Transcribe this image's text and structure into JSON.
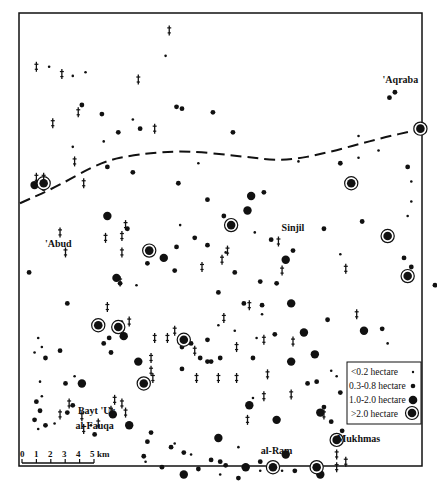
{
  "map": {
    "units": "km",
    "extent_km": {
      "width": 22.1,
      "height": 24.9
    },
    "colors": {
      "ink": "#111111",
      "paper": "#ffffff"
    }
  },
  "scale_bar": {
    "ticks": [
      "0",
      "1",
      "2",
      "3",
      "4",
      "5"
    ],
    "unit_label": "km",
    "length_km": 5
  },
  "legend": {
    "items": [
      {
        "label": "<0.2 hectare",
        "symbol": "tiny-dot"
      },
      {
        "label": "0.3-0.8 hectare",
        "symbol": "small-dot"
      },
      {
        "label": "1.0-2.0 hectare",
        "symbol": "large-dot"
      },
      {
        "label": ">2.0 hectare",
        "symbol": "ringed-dot"
      }
    ]
  },
  "places": [
    {
      "name": "'Aqraba",
      "x": 20.9,
      "y": 3.8
    },
    {
      "name": "Sinjil",
      "x": 15.0,
      "y": 11.9
    },
    {
      "name": "'Abud",
      "x": 2.1,
      "y": 12.8
    },
    {
      "name": "Bayt 'Ur",
      "x": 4.2,
      "y": 22.0
    },
    {
      "name": "al-Fauqa",
      "x": 4.1,
      "y": 22.8
    },
    {
      "name": "al-Ram",
      "x": 14.1,
      "y": 24.2
    },
    {
      "name": "Mukhmas",
      "x": 18.6,
      "y": 23.5
    }
  ],
  "boundary_km": [
    [
      0,
      10.4
    ],
    [
      2,
      9.5
    ],
    [
      4.5,
      8.1
    ],
    [
      6.5,
      7.7
    ],
    [
      9,
      7.5
    ],
    [
      12,
      7.8
    ],
    [
      14.5,
      8.1
    ],
    [
      17,
      7.6
    ],
    [
      19.5,
      6.9
    ],
    [
      22.1,
      6.3
    ]
  ],
  "sites": [
    {
      "x": 1.6,
      "y": 2.9,
      "c": "tiny"
    },
    {
      "x": 2.9,
      "y": 3.4,
      "c": "tiny"
    },
    {
      "x": 3.6,
      "y": 3.2,
      "c": "tiny"
    },
    {
      "x": 8.0,
      "y": 2.3,
      "c": "tiny"
    },
    {
      "x": 3.4,
      "y": 5.0,
      "c": "small"
    },
    {
      "x": 4.5,
      "y": 5.5,
      "c": "small"
    },
    {
      "x": 6.2,
      "y": 5.8,
      "c": "tiny"
    },
    {
      "x": 8.9,
      "y": 5.2,
      "c": "small"
    },
    {
      "x": 5.4,
      "y": 6.5,
      "c": "small"
    },
    {
      "x": 6.6,
      "y": 6.3,
      "c": "small"
    },
    {
      "x": 1.3,
      "y": 9.6,
      "c": "small"
    },
    {
      "x": 4.6,
      "y": 7.0,
      "c": "tiny"
    },
    {
      "x": 4.8,
      "y": 8.4,
      "c": "small"
    },
    {
      "x": 6.2,
      "y": 8.7,
      "c": "small"
    },
    {
      "x": 2.9,
      "y": 7.3,
      "c": "tiny"
    },
    {
      "x": 10.3,
      "y": 10.2,
      "c": "small"
    },
    {
      "x": 10.6,
      "y": 5.4,
      "c": "small"
    },
    {
      "x": 11.7,
      "y": 6.5,
      "c": "small"
    },
    {
      "x": 8.7,
      "y": 9.3,
      "c": "small"
    },
    {
      "x": 13.4,
      "y": 9.8,
      "c": "small"
    },
    {
      "x": 9.8,
      "y": 8.2,
      "c": "tiny"
    },
    {
      "x": 8.6,
      "y": 5.1,
      "c": "small"
    },
    {
      "x": 17.6,
      "y": 8.2,
      "c": "small"
    },
    {
      "x": 18.6,
      "y": 7.9,
      "c": "tiny"
    },
    {
      "x": 20.3,
      "y": 4.6,
      "c": "small"
    },
    {
      "x": 18.6,
      "y": 6.7,
      "c": "tiny"
    },
    {
      "x": 20.6,
      "y": 4.3,
      "c": "small"
    },
    {
      "x": 19.7,
      "y": 7.5,
      "c": "tiny"
    },
    {
      "x": 15.3,
      "y": 8.1,
      "c": "tiny"
    },
    {
      "x": 21.3,
      "y": 8.4,
      "c": "small"
    },
    {
      "x": 21.5,
      "y": 9.2,
      "c": "tiny"
    },
    {
      "x": 21.5,
      "y": 10.3,
      "c": "tiny"
    },
    {
      "x": 21.3,
      "y": 11.1,
      "c": "tiny"
    },
    {
      "x": 21.1,
      "y": 13.4,
      "c": "small"
    },
    {
      "x": 21.5,
      "y": 13.9,
      "c": "small"
    },
    {
      "x": 21.5,
      "y": 14.3,
      "c": "small"
    },
    {
      "x": 17.6,
      "y": 13.2,
      "c": "tiny"
    },
    {
      "x": 16.7,
      "y": 11.8,
      "c": "small"
    },
    {
      "x": 18.8,
      "y": 11.4,
      "c": "small"
    },
    {
      "x": 15.0,
      "y": 13.0,
      "c": "small"
    },
    {
      "x": 13.8,
      "y": 12.4,
      "c": "small"
    },
    {
      "x": 12.9,
      "y": 12.0,
      "c": "tiny"
    },
    {
      "x": 11.2,
      "y": 11.1,
      "c": "small"
    },
    {
      "x": 8.8,
      "y": 11.6,
      "c": "tiny"
    },
    {
      "x": 8.5,
      "y": 14.1,
      "c": "small"
    },
    {
      "x": 11.8,
      "y": 14.2,
      "c": "small"
    },
    {
      "x": 14.1,
      "y": 14.8,
      "c": "small"
    },
    {
      "x": 13.2,
      "y": 14.7,
      "c": "small"
    },
    {
      "x": 10.9,
      "y": 15.3,
      "c": "small"
    },
    {
      "x": 12.3,
      "y": 15.9,
      "c": "small"
    },
    {
      "x": 13.3,
      "y": 16.0,
      "c": "small"
    },
    {
      "x": 16.9,
      "y": 16.8,
      "c": "small"
    },
    {
      "x": 18.9,
      "y": 17.4,
      "c": "large"
    },
    {
      "x": 19.9,
      "y": 17.3,
      "c": "small"
    },
    {
      "x": 11.8,
      "y": 17.4,
      "c": "tiny"
    },
    {
      "x": 13.3,
      "y": 16.5,
      "c": "tiny"
    },
    {
      "x": 14.0,
      "y": 17.6,
      "c": "small"
    },
    {
      "x": 10.3,
      "y": 17.9,
      "c": "small"
    },
    {
      "x": 10.9,
      "y": 17.1,
      "c": "tiny"
    },
    {
      "x": 13.0,
      "y": 17.8,
      "c": "tiny"
    },
    {
      "x": 9.4,
      "y": 18.1,
      "c": "small"
    },
    {
      "x": 8.9,
      "y": 18.3,
      "c": "small"
    },
    {
      "x": 9.9,
      "y": 18.9,
      "c": "small"
    },
    {
      "x": 10.5,
      "y": 19.1,
      "c": "small"
    },
    {
      "x": 11.0,
      "y": 18.9,
      "c": "small"
    },
    {
      "x": 12.8,
      "y": 18.9,
      "c": "small"
    },
    {
      "x": 16.3,
      "y": 20.2,
      "c": "small"
    },
    {
      "x": 15.8,
      "y": 20.3,
      "c": "small"
    },
    {
      "x": 17.1,
      "y": 19.6,
      "c": "tiny"
    },
    {
      "x": 17.4,
      "y": 19.9,
      "c": "tiny"
    },
    {
      "x": 16.5,
      "y": 21.9,
      "c": "large"
    },
    {
      "x": 16.7,
      "y": 21.6,
      "c": "small"
    },
    {
      "x": 14.1,
      "y": 22.3,
      "c": "large"
    },
    {
      "x": 12.8,
      "y": 21.1,
      "c": "tiny"
    },
    {
      "x": 17.1,
      "y": 22.4,
      "c": "small"
    },
    {
      "x": 17.7,
      "y": 22.9,
      "c": "small"
    },
    {
      "x": 17.6,
      "y": 20.8,
      "c": "small"
    },
    {
      "x": 20.2,
      "y": 18.1,
      "c": "tiny"
    },
    {
      "x": 9.6,
      "y": 12.3,
      "c": "small"
    },
    {
      "x": 5.9,
      "y": 11.8,
      "c": "small"
    },
    {
      "x": 7.9,
      "y": 13.4,
      "c": "large"
    },
    {
      "x": 8.6,
      "y": 12.8,
      "c": "small"
    },
    {
      "x": 10.3,
      "y": 12.7,
      "c": "small"
    },
    {
      "x": 11.3,
      "y": 13.1,
      "c": "tiny"
    },
    {
      "x": 5.5,
      "y": 14.8,
      "c": "small"
    },
    {
      "x": 6.4,
      "y": 14.9,
      "c": "tiny"
    },
    {
      "x": 7.0,
      "y": 13.7,
      "c": "small"
    },
    {
      "x": 0.5,
      "y": 14.2,
      "c": "small"
    },
    {
      "x": 2.6,
      "y": 15.9,
      "c": "small"
    },
    {
      "x": 3.0,
      "y": 19.9,
      "c": "tiny"
    },
    {
      "x": 4.9,
      "y": 17.8,
      "c": "small"
    },
    {
      "x": 4.6,
      "y": 18.1,
      "c": "small"
    },
    {
      "x": 5.7,
      "y": 17.7,
      "c": "large"
    },
    {
      "x": 4.1,
      "y": 17.2,
      "c": "tiny"
    },
    {
      "x": 5.6,
      "y": 16.9,
      "c": "tiny"
    },
    {
      "x": 5.0,
      "y": 18.6,
      "c": "small"
    },
    {
      "x": 1.0,
      "y": 17.8,
      "c": "tiny"
    },
    {
      "x": 1.2,
      "y": 18.3,
      "c": "tiny"
    },
    {
      "x": 8.9,
      "y": 19.5,
      "c": "small"
    },
    {
      "x": 10.3,
      "y": 19.1,
      "c": "small"
    },
    {
      "x": 0.8,
      "y": 18.6,
      "c": "tiny"
    },
    {
      "x": 2.2,
      "y": 18.5,
      "c": "small"
    },
    {
      "x": 1.4,
      "y": 18.9,
      "c": "small"
    },
    {
      "x": 2.5,
      "y": 20.3,
      "c": "small"
    },
    {
      "x": 1.1,
      "y": 20.2,
      "c": "tiny"
    },
    {
      "x": 1.2,
      "y": 21.0,
      "c": "tiny"
    },
    {
      "x": 0.9,
      "y": 21.3,
      "c": "small"
    },
    {
      "x": 1.1,
      "y": 21.8,
      "c": "small"
    },
    {
      "x": 0.8,
      "y": 22.3,
      "c": "small"
    },
    {
      "x": 1.4,
      "y": 22.6,
      "c": "small"
    },
    {
      "x": 1.9,
      "y": 22.5,
      "c": "tiny"
    },
    {
      "x": 2.9,
      "y": 21.5,
      "c": "small"
    },
    {
      "x": 2.6,
      "y": 21.9,
      "c": "small"
    },
    {
      "x": 3.9,
      "y": 22.6,
      "c": "tiny"
    },
    {
      "x": 1.0,
      "y": 22.8,
      "c": "tiny"
    },
    {
      "x": 4.1,
      "y": 23.1,
      "c": "small"
    },
    {
      "x": 5.1,
      "y": 22.0,
      "c": "large"
    },
    {
      "x": 6.0,
      "y": 22.6,
      "c": "large"
    },
    {
      "x": 7.2,
      "y": 23.0,
      "c": "small"
    },
    {
      "x": 7.0,
      "y": 23.5,
      "c": "small"
    },
    {
      "x": 6.8,
      "y": 24.3,
      "c": "small"
    },
    {
      "x": 8.5,
      "y": 23.6,
      "c": "tiny"
    },
    {
      "x": 8.3,
      "y": 23.8,
      "c": "small"
    },
    {
      "x": 9.0,
      "y": 24.1,
      "c": "small"
    },
    {
      "x": 9.8,
      "y": 25.0,
      "c": "small"
    },
    {
      "x": 9.4,
      "y": 24.2,
      "c": "tiny"
    },
    {
      "x": 10.5,
      "y": 24.5,
      "c": "small"
    },
    {
      "x": 11.0,
      "y": 24.6,
      "c": "small"
    },
    {
      "x": 12.0,
      "y": 23.8,
      "c": "tiny"
    },
    {
      "x": 11.3,
      "y": 24.8,
      "c": "small"
    },
    {
      "x": 6.9,
      "y": 24.6,
      "c": "tiny"
    },
    {
      "x": 7.8,
      "y": 24.9,
      "c": "small"
    },
    {
      "x": 9.0,
      "y": 25.3,
      "c": "large"
    },
    {
      "x": 11.0,
      "y": 25.3,
      "c": "tiny"
    },
    {
      "x": 12.4,
      "y": 24.9,
      "c": "large"
    },
    {
      "x": 13.2,
      "y": 24.6,
      "c": "small"
    },
    {
      "x": 12.0,
      "y": 25.5,
      "c": "small"
    },
    {
      "x": 13.2,
      "y": 25.1,
      "c": "tiny"
    },
    {
      "x": 14.6,
      "y": 24.2,
      "c": "large"
    },
    {
      "x": 15.1,
      "y": 25.1,
      "c": "small"
    },
    {
      "x": 14.4,
      "y": 25.1,
      "c": "tiny"
    },
    {
      "x": 0.8,
      "y": 9.4,
      "c": "large"
    },
    {
      "x": 4.8,
      "y": 11.1,
      "c": "large"
    },
    {
      "x": 12.5,
      "y": 10.8,
      "c": "large"
    },
    {
      "x": 14.6,
      "y": 13.5,
      "c": "large"
    },
    {
      "x": 12.7,
      "y": 10.0,
      "c": "large"
    },
    {
      "x": 5.3,
      "y": 14.5,
      "c": "large"
    },
    {
      "x": 15.6,
      "y": 17.5,
      "c": "large"
    },
    {
      "x": 14.9,
      "y": 15.9,
      "c": "large"
    },
    {
      "x": 16.2,
      "y": 18.7,
      "c": "large"
    },
    {
      "x": 14.9,
      "y": 19.1,
      "c": "large"
    },
    {
      "x": 6.5,
      "y": 19.1,
      "c": "large"
    },
    {
      "x": 3.4,
      "y": 20.3,
      "c": "large"
    },
    {
      "x": 10.9,
      "y": 23.3,
      "c": "large"
    },
    {
      "x": 16.5,
      "y": 25.3,
      "c": "large"
    },
    {
      "x": 12.6,
      "y": 21.5,
      "c": "large"
    },
    {
      "x": 22.8,
      "y": 14.9,
      "c": "small"
    },
    {
      "x": 7.1,
      "y": 13.0,
      "c": "ringed"
    },
    {
      "x": 1.3,
      "y": 9.3,
      "c": "ringed"
    },
    {
      "x": 11.6,
      "y": 11.6,
      "c": "ringed"
    },
    {
      "x": 18.2,
      "y": 9.3,
      "c": "ringed"
    },
    {
      "x": 22.0,
      "y": 6.3,
      "c": "ringed"
    },
    {
      "x": 20.2,
      "y": 12.2,
      "c": "ringed"
    },
    {
      "x": 21.3,
      "y": 14.4,
      "c": "ringed"
    },
    {
      "x": 4.3,
      "y": 17.1,
      "c": "ringed"
    },
    {
      "x": 5.4,
      "y": 17.2,
      "c": "ringed"
    },
    {
      "x": 9.0,
      "y": 17.9,
      "c": "ringed"
    },
    {
      "x": 6.8,
      "y": 20.3,
      "c": "ringed"
    },
    {
      "x": 13.9,
      "y": 24.9,
      "c": "ringed"
    },
    {
      "x": 16.3,
      "y": 24.9,
      "c": "ringed"
    },
    {
      "x": 17.4,
      "y": 23.4,
      "c": "ringed"
    }
  ],
  "crosses": [
    {
      "x": 8.2,
      "y": 0.9
    },
    {
      "x": 0.9,
      "y": 2.9
    },
    {
      "x": 2.3,
      "y": 3.3
    },
    {
      "x": 6.5,
      "y": 3.6
    },
    {
      "x": 3.2,
      "y": 5.4
    },
    {
      "x": 1.8,
      "y": 6.0
    },
    {
      "x": 3.0,
      "y": 8.1
    },
    {
      "x": 1.3,
      "y": 9.0
    },
    {
      "x": 0.9,
      "y": 9.0
    },
    {
      "x": 7.4,
      "y": 6.3
    },
    {
      "x": 3.5,
      "y": 9.3
    },
    {
      "x": 2.2,
      "y": 12.0
    },
    {
      "x": 2.5,
      "y": 13.1
    },
    {
      "x": 5.8,
      "y": 11.6
    },
    {
      "x": 5.6,
      "y": 12.2
    },
    {
      "x": 4.7,
      "y": 12.3
    },
    {
      "x": 5.6,
      "y": 13.1
    },
    {
      "x": 11.1,
      "y": 13.5
    },
    {
      "x": 11.4,
      "y": 13.0
    },
    {
      "x": 14.2,
      "y": 12.5
    },
    {
      "x": 14.4,
      "y": 14.1
    },
    {
      "x": 5.5,
      "y": 14.7
    },
    {
      "x": 4.8,
      "y": 16.1
    },
    {
      "x": 10.0,
      "y": 13.9
    },
    {
      "x": 6.0,
      "y": 16.9
    },
    {
      "x": 7.4,
      "y": 17.8
    },
    {
      "x": 8.1,
      "y": 17.8
    },
    {
      "x": 8.5,
      "y": 17.4
    },
    {
      "x": 11.2,
      "y": 16.7
    },
    {
      "x": 13.4,
      "y": 17.9
    },
    {
      "x": 15.0,
      "y": 18.0
    },
    {
      "x": 17.9,
      "y": 14.0
    },
    {
      "x": 18.5,
      "y": 16.5
    },
    {
      "x": 13.6,
      "y": 19.8
    },
    {
      "x": 13.4,
      "y": 21.0
    },
    {
      "x": 11.9,
      "y": 20.0
    },
    {
      "x": 7.2,
      "y": 18.9
    },
    {
      "x": 7.2,
      "y": 19.6
    },
    {
      "x": 9.6,
      "y": 18.5
    },
    {
      "x": 12.6,
      "y": 16.0
    },
    {
      "x": 11.9,
      "y": 18.3
    },
    {
      "x": 2.7,
      "y": 21.4
    },
    {
      "x": 2.2,
      "y": 22.0
    },
    {
      "x": 3.4,
      "y": 22.1
    },
    {
      "x": 7.3,
      "y": 20.0
    },
    {
      "x": 9.7,
      "y": 20.0
    },
    {
      "x": 10.9,
      "y": 20.0
    },
    {
      "x": 3.5,
      "y": 22.8
    },
    {
      "x": 4.3,
      "y": 22.5
    },
    {
      "x": 5.2,
      "y": 21.2
    },
    {
      "x": 5.0,
      "y": 21.8
    },
    {
      "x": 5.6,
      "y": 21.4
    },
    {
      "x": 5.8,
      "y": 21.9
    },
    {
      "x": 14.9,
      "y": 20.9
    },
    {
      "x": 16.7,
      "y": 22.0
    },
    {
      "x": 17.4,
      "y": 24.2
    },
    {
      "x": 17.4,
      "y": 24.9
    },
    {
      "x": 17.9,
      "y": 24.6
    },
    {
      "x": 12.5,
      "y": 22.3
    }
  ]
}
